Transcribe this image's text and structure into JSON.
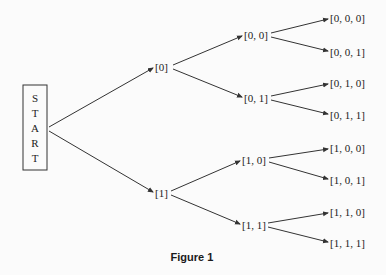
{
  "start": {
    "letters": [
      "S",
      "T",
      "A",
      "R",
      "T"
    ]
  },
  "level1": [
    {
      "label": "[0]"
    },
    {
      "label": "[1]"
    }
  ],
  "level2": [
    {
      "label": "[0, 0]"
    },
    {
      "label": "[0, 1]"
    },
    {
      "label": "[1, 0]"
    },
    {
      "label": "[1, 1]"
    }
  ],
  "level3": [
    {
      "label": "[0, 0, 0]"
    },
    {
      "label": "[0, 0, 1]"
    },
    {
      "label": "[0, 1, 0]"
    },
    {
      "label": "[0, 1, 1]"
    },
    {
      "label": "[1, 0, 0]"
    },
    {
      "label": "[1, 0, 1]"
    },
    {
      "label": "[1, 1, 0]"
    },
    {
      "label": "[1, 1, 1]"
    }
  ],
  "caption": "Figure 1",
  "colors": {
    "line": "#333333",
    "text": "#222222",
    "background": "#fbfbfb"
  }
}
